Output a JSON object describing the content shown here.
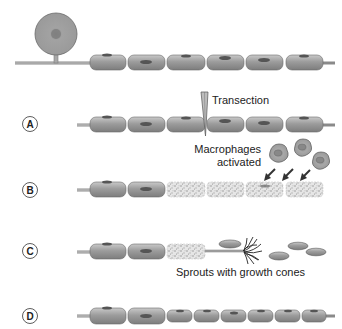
{
  "diagram": {
    "stages": [
      {
        "id": "top",
        "label": "",
        "description": "Intact neuron with myelinated axon"
      },
      {
        "id": "A",
        "label": "A",
        "description": "Transection of axon"
      },
      {
        "id": "B",
        "label": "B",
        "description": "Distal myelin degenerates; macrophages activated"
      },
      {
        "id": "C",
        "label": "C",
        "description": "Axon sprouts with growth cones"
      },
      {
        "id": "D",
        "label": "D",
        "description": "Regenerated axon with shorter internodes"
      }
    ],
    "annotations": {
      "transection": "Transection",
      "macrophages_line1": "Macrophages",
      "macrophages_line2": "activated",
      "sprouts": "Sprouts with growth cones"
    },
    "colors": {
      "myelin": "#9a9a9a",
      "myelin_light": "#c4c4c4",
      "nucleus": "#555555",
      "axon": "#b0b0b0",
      "outline": "#6a6a6a",
      "debris": "#bdbdbd"
    }
  }
}
